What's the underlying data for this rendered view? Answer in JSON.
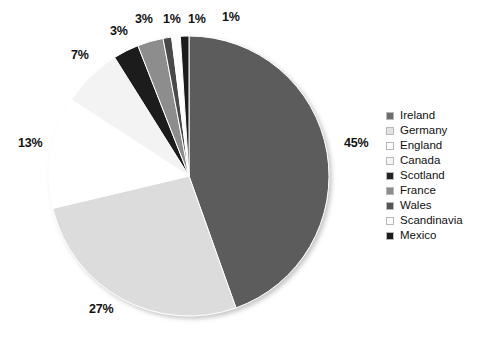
{
  "chart_data": {
    "type": "pie",
    "title": "",
    "categories": [
      "Ireland",
      "Germany",
      "England",
      "Canada",
      "Scotland",
      "France",
      "Wales",
      "Scandinavia",
      "Mexico"
    ],
    "values": [
      45,
      27,
      13,
      7,
      3,
      3,
      1,
      1,
      1
    ],
    "value_labels": [
      "45%",
      "27%",
      "13%",
      "7%",
      "3%",
      "3%",
      "1%",
      "1%",
      "1%"
    ],
    "colors": [
      "#5c5c5c",
      "#dcdcdc",
      "#ffffff",
      "#f3f3f3",
      "#1c1c1c",
      "#8d8d8d",
      "#4a4a4a",
      "#fdfdfd",
      "#1c1c1c"
    ],
    "legend_position": "right",
    "grid": false,
    "start_angle_deg": 0,
    "direction": "clockwise"
  },
  "legend": {
    "items": [
      {
        "label": "Ireland",
        "color": "#6e6e6e"
      },
      {
        "label": "Germany",
        "color": "#e2e2e2"
      },
      {
        "label": "England",
        "color": "#ffffff"
      },
      {
        "label": "Canada",
        "color": "#f5f5f5"
      },
      {
        "label": "Scotland",
        "color": "#222222"
      },
      {
        "label": "France",
        "color": "#8d8d8d"
      },
      {
        "label": "Wales",
        "color": "#555555"
      },
      {
        "label": "Scandinavia",
        "color": "#fbfbfb"
      },
      {
        "label": "Mexico",
        "color": "#1c1c1c"
      }
    ]
  },
  "slice_labels": [
    {
      "text": "45%",
      "x": 344,
      "y": 136
    },
    {
      "text": "27%",
      "x": 89,
      "y": 302
    },
    {
      "text": "13%",
      "x": 18,
      "y": 136
    },
    {
      "text": "7%",
      "x": 71,
      "y": 48
    },
    {
      "text": "3%",
      "x": 110,
      "y": 24
    },
    {
      "text": "3%",
      "x": 135,
      "y": 12
    },
    {
      "text": "1%",
      "x": 163,
      "y": 12
    },
    {
      "text": "1%",
      "x": 188,
      "y": 12
    },
    {
      "text": "1%",
      "x": 222,
      "y": 10
    }
  ]
}
